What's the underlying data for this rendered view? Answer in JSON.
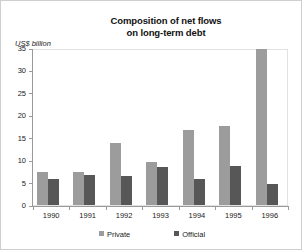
{
  "chart_data": {
    "type": "bar",
    "title": "Composition of net flows on long-term debt",
    "title_line1": "Composition of net flows",
    "title_line2": "on long-term debt",
    "xlabel": "",
    "ylabel": "US$ billion",
    "ylim": [
      0,
      35
    ],
    "yticks": [
      0,
      5,
      10,
      15,
      20,
      25,
      30,
      35
    ],
    "ytick_labels": [
      "0",
      "5",
      "10",
      "15",
      "20",
      "25",
      "30",
      "35"
    ],
    "grid": false,
    "legend_position": "bottom",
    "categories": [
      "1990",
      "1991",
      "1992",
      "1993",
      "1994",
      "1995",
      "1996"
    ],
    "series": [
      {
        "name": "Private",
        "color": "#9c9c9c",
        "values": [
          7.4,
          7.3,
          13.9,
          9.7,
          16.7,
          17.6,
          34.7
        ]
      },
      {
        "name": "Official",
        "color": "#575757",
        "values": [
          5.7,
          6.7,
          6.4,
          8.5,
          5.8,
          8.6,
          4.6
        ]
      }
    ]
  },
  "figure": {
    "background": "#ffffff",
    "border_color": "#cfcfcf",
    "axis_color": "#9a9a9a"
  }
}
